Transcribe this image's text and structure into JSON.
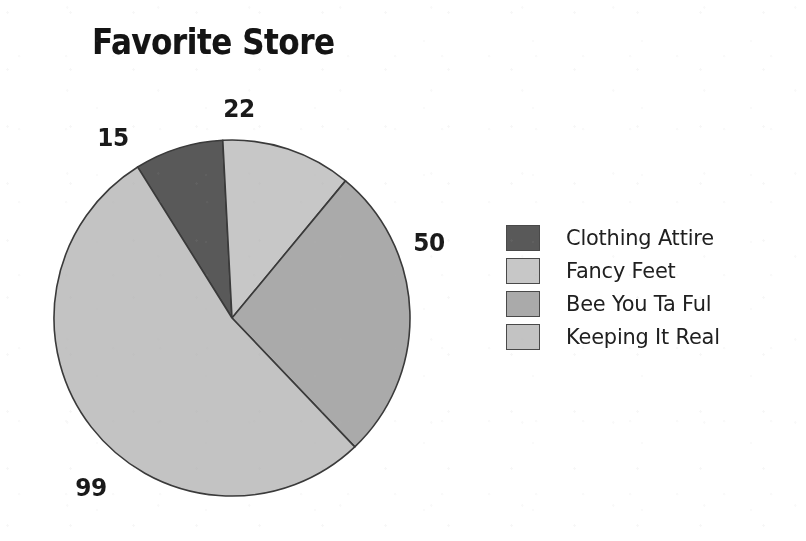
{
  "chart_data": {
    "type": "pie",
    "title": "Favorite Store",
    "categories": [
      "Clothing Attire",
      "Fancy Feet",
      "Bee You Ta Ful",
      "Keeping It Real"
    ],
    "values": [
      15,
      22,
      50,
      99
    ],
    "data_labels": [
      "15",
      "22",
      "50",
      "99"
    ],
    "total": 186,
    "colors": [
      "#5a5a5a",
      "#c6c6c6",
      "#a9a9a9",
      "#c2c2c2"
    ],
    "slice_border_color": "#3b3b3b",
    "start_angle_deg": -32,
    "legend_position": "right",
    "grid": false,
    "xlabel": "",
    "ylabel": ""
  },
  "title": {
    "text": "Favorite Store"
  },
  "labels": {
    "clothing_attire": "15",
    "fancy_feet": "22",
    "bee_you_ta_ful": "50",
    "keeping_it_real": "99"
  },
  "legend": {
    "items": [
      {
        "label": "Clothing Attire",
        "color": "#5a5a5a"
      },
      {
        "label": "Fancy Feet",
        "color": "#c6c6c6"
      },
      {
        "label": "Bee You Ta Ful",
        "color": "#a9a9a9"
      },
      {
        "label": "Keeping It Real",
        "color": "#c2c2c2"
      }
    ]
  }
}
